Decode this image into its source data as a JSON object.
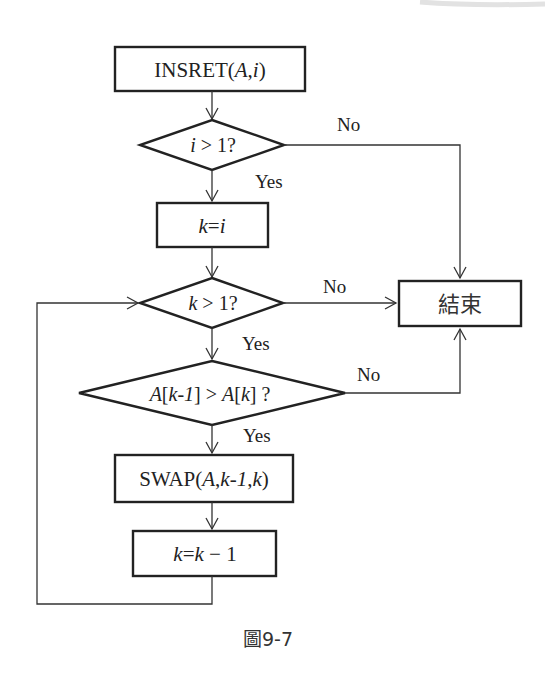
{
  "figure": {
    "caption": "圖9-7"
  },
  "nodes": {
    "start": {
      "type": "process",
      "prefix": "INSRET(",
      "arg1": "A",
      "comma": ",",
      "arg2": "i",
      "suffix": ")"
    },
    "cond_i": {
      "type": "decision",
      "var": "i",
      "op": " > 1?"
    },
    "assign_k": {
      "type": "process",
      "lhs": "k",
      "eq": "=",
      "rhs": "i"
    },
    "cond_k": {
      "type": "decision",
      "var": "k",
      "op": " > 1?"
    },
    "cond_compare": {
      "type": "decision",
      "a1": "A",
      "b1": "[",
      "k1": "k",
      "m1": "-",
      "one1": "1",
      "c1": "]",
      "gt": " > ",
      "a2": "A",
      "b2": "[",
      "k2": "k",
      "c2": "] ?"
    },
    "swap": {
      "type": "process",
      "prefix": "SWAP(",
      "a": "A",
      "c1": ",",
      "k1": "k",
      "m": "-",
      "one": "1",
      "c2": ",",
      "k2": "k",
      "suffix": ")"
    },
    "decrement": {
      "type": "process",
      "lhs": "k",
      "eq": "=",
      "rhs": "k",
      "minus": " − 1"
    },
    "end": {
      "type": "terminal",
      "label": "結束"
    }
  },
  "edge_labels": {
    "cond_i_no": "No",
    "cond_i_yes": "Yes",
    "cond_k_no": "No",
    "cond_k_yes": "Yes",
    "cond_compare_no": "No",
    "cond_compare_yes": "Yes"
  },
  "colors": {
    "stroke": "#222222",
    "background": "#ffffff"
  }
}
